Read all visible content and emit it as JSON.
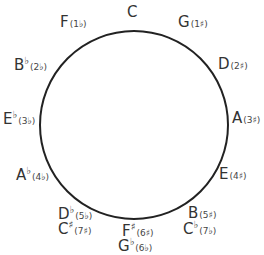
{
  "circle": {
    "cx": 134,
    "cy": 125,
    "r": 94,
    "stroke": "#222222"
  },
  "keys": [
    {
      "id": "c",
      "note": "C",
      "acc": "",
      "count": "",
      "x": 127,
      "y": 4
    },
    {
      "id": "g",
      "note": "G",
      "acc": "",
      "count": "(1♯)",
      "x": 178,
      "y": 14
    },
    {
      "id": "d",
      "note": "D",
      "acc": "",
      "count": "(2♯)",
      "x": 218,
      "y": 56
    },
    {
      "id": "a",
      "note": "A",
      "acc": "",
      "count": "(3♯)",
      "x": 232,
      "y": 110
    },
    {
      "id": "e",
      "note": "E",
      "acc": "",
      "count": "(4♯)",
      "x": 219,
      "y": 166
    },
    {
      "id": "b",
      "note": "B",
      "acc": "",
      "count": "(5♯)",
      "x": 188,
      "y": 205
    },
    {
      "id": "cb",
      "note": "C",
      "acc": "♭",
      "count": "(7♭)",
      "x": 183,
      "y": 220
    },
    {
      "id": "fs",
      "note": "F",
      "acc": "♯",
      "count": "(6♯)",
      "x": 122,
      "y": 222
    },
    {
      "id": "gb",
      "note": "G",
      "acc": "♭",
      "count": "(6♭)",
      "x": 118,
      "y": 237
    },
    {
      "id": "db",
      "note": "D",
      "acc": "♭",
      "count": "(5♭)",
      "x": 58,
      "y": 205
    },
    {
      "id": "cs",
      "note": "C",
      "acc": "♯",
      "count": "(7♯)",
      "x": 58,
      "y": 220
    },
    {
      "id": "ab",
      "note": "A",
      "acc": "♭",
      "count": "(4♭)",
      "x": 16,
      "y": 166
    },
    {
      "id": "eb",
      "note": "E",
      "acc": "♭",
      "count": "(3♭)",
      "x": 3,
      "y": 110
    },
    {
      "id": "bb",
      "note": "B",
      "acc": "♭",
      "count": "(2♭)",
      "x": 14,
      "y": 56
    },
    {
      "id": "f",
      "note": "F",
      "acc": "",
      "count": "(1♭)",
      "x": 60,
      "y": 14
    }
  ]
}
